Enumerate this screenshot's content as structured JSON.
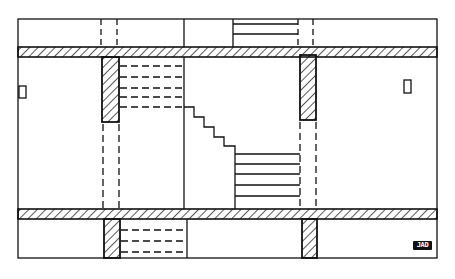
{
  "diagram": {
    "type": "architectural-section",
    "stamp_label": "JAD",
    "colors": {
      "line": "#111111",
      "background": "#ffffff"
    }
  }
}
